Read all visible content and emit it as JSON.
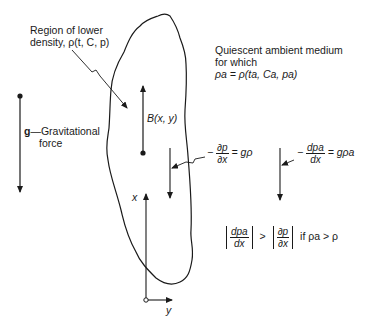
{
  "labels": {
    "region_line1": "Region of lower",
    "region_line2": "density, ρ(t, C, p)",
    "ambient_line1": "Quiescent ambient medium",
    "ambient_line2": "for which",
    "ambient_line3": "ρa = ρ(ta, Ca, pa)",
    "gravity_symbol": "g",
    "gravity_label_line1": "—Gravitational",
    "gravity_label_line2": "force",
    "buoyancy": "B(x, y)",
    "axis_x": "x",
    "axis_y": "y"
  },
  "equations": {
    "inner_gradient": {
      "sign": "−",
      "num": "∂p",
      "den": "∂x",
      "rhs": "= gρ"
    },
    "outer_gradient": {
      "sign": "−",
      "num": "dpa",
      "den": "dx",
      "rhs": "= gρa"
    },
    "inequality": {
      "left_num": "dpa",
      "left_den": "dx",
      "op": ">",
      "right_num": "∂p",
      "right_den": "∂x",
      "condition": "if  ρa > ρ"
    }
  },
  "colors": {
    "ink": "#1a1a1a",
    "background": "#ffffff"
  }
}
